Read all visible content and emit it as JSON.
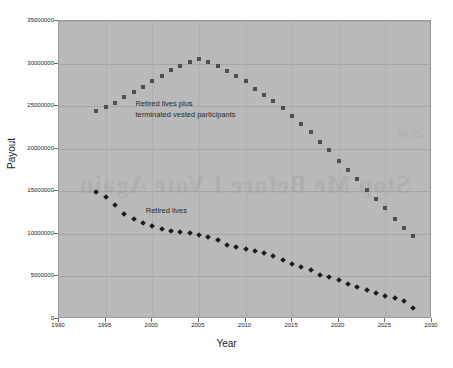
{
  "chart_data": {
    "type": "scatter",
    "title": "",
    "xlabel": "Year",
    "ylabel": "Payout",
    "xlim": [
      1990,
      2030
    ],
    "ylim": [
      0,
      35000000
    ],
    "xticks": [
      1990,
      1995,
      2000,
      2005,
      2010,
      2015,
      2020,
      2025,
      2030
    ],
    "xtick_labels": [
      "1990",
      "1995",
      "2000",
      "2005",
      "2010",
      "2015",
      "2020",
      "2025",
      "2030"
    ],
    "yticks": [
      0,
      5000000,
      10000000,
      15000000,
      20000000,
      25000000,
      30000000,
      35000000
    ],
    "ytick_labels": [
      "0",
      "5000000",
      "10000000",
      "15000000",
      "20000000",
      "25000000",
      "30000000",
      "35000000"
    ],
    "grid": true,
    "legend": "annotations-inline",
    "plot_background": "#b9b9b9",
    "annotations": [
      {
        "name": "upper-series-label",
        "lines": [
          "Retired lives plus",
          "terminated vested participants"
        ],
        "x": 1998.2,
        "y": 25300000
      },
      {
        "name": "lower-series-label",
        "lines": [
          "Retired lives"
        ],
        "x": 1999.3,
        "y": 12700000
      }
    ],
    "series": [
      {
        "name": "Retired lives plus terminated vested participants",
        "marker": "square",
        "color": "#4e4e4e",
        "x": [
          1994,
          1995,
          1996,
          1997,
          1998,
          1999,
          2000,
          2001,
          2002,
          2003,
          2004,
          2005,
          2006,
          2007,
          2008,
          2009,
          2010,
          2011,
          2012,
          2013,
          2014,
          2015,
          2016,
          2017,
          2018,
          2019,
          2020,
          2021,
          2022,
          2023,
          2024,
          2025,
          2026,
          2027,
          2028
        ],
        "values": [
          24400000,
          24900000,
          25400000,
          26100000,
          26700000,
          27300000,
          27900000,
          28500000,
          29200000,
          29700000,
          30200000,
          30500000,
          30200000,
          29700000,
          29100000,
          28500000,
          27900000,
          27000000,
          26300000,
          25600000,
          24800000,
          23800000,
          22900000,
          22000000,
          20800000,
          19800000,
          18600000,
          17500000,
          16400000,
          15200000,
          14100000,
          13000000,
          11800000,
          10700000,
          9700000
        ]
      },
      {
        "name": "Retired lives",
        "marker": "diamond",
        "color": "#1b1b1b",
        "x": [
          1994,
          1995,
          1996,
          1997,
          1998,
          1999,
          2000,
          2001,
          2002,
          2003,
          2004,
          2005,
          2006,
          2007,
          2008,
          2009,
          2010,
          2011,
          2012,
          2013,
          2014,
          2015,
          2016,
          2017,
          2018,
          2019,
          2020,
          2021,
          2022,
          2023,
          2024,
          2025,
          2026,
          2027,
          2028
        ],
        "values": [
          14900000,
          14350000,
          13400000,
          12300000,
          11700000,
          11250000,
          10900000,
          10550000,
          10300000,
          10200000,
          10100000,
          9900000,
          9600000,
          9250000,
          8700000,
          8500000,
          8200000,
          8000000,
          7700000,
          7350000,
          6900000,
          6500000,
          6050000,
          5750000,
          5200000,
          4950000,
          4550000,
          4150000,
          3750000,
          3400000,
          3100000,
          2750000,
          2450000,
          2150000,
          1300000
        ]
      }
    ]
  },
  "watermark": {
    "line": "Stop Me Before I Vote Again",
    "line2": "2030"
  }
}
